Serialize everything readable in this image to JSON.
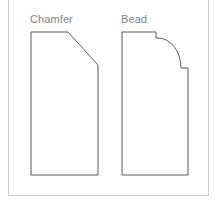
{
  "figure": {
    "background_color": "#ffffff",
    "frame": {
      "name": "diagram-frame",
      "border_color": "#c8cacc",
      "x": 8,
      "y": 0,
      "width": 201,
      "height": 196
    },
    "line_color": "#58595b",
    "label_color": "#808285"
  },
  "shapes": [
    {
      "id": "chamfer",
      "label": "Chamfer",
      "type": "chamfer-profile",
      "description": "Rectangular profile with top-right corner cut away at a 45 degree angle",
      "label_x": 30,
      "label_y": 13,
      "path": "M 31 32 L 68 32 L 98 65 L 98 175 L 31 175 Z",
      "vertices": [
        [
          31,
          32
        ],
        [
          68,
          32
        ],
        [
          98,
          65
        ],
        [
          98,
          175
        ],
        [
          31,
          175
        ]
      ]
    },
    {
      "id": "bead",
      "label": "Bead",
      "type": "bead-profile",
      "description": "Rectangular profile with a convex quarter-round arc between two small square step notches",
      "label_x": 121,
      "label_y": 13,
      "path": "M 122 32 L 156 32 L 156 38 L 158 38 A 23 30 0 0 1 181 68 L 181 68 L 188 68 L 188 175 L 122 175 Z",
      "vertices": [
        [
          122,
          32
        ],
        [
          156,
          32
        ],
        [
          156,
          38
        ],
        [
          158,
          38
        ],
        [
          181,
          68
        ],
        [
          188,
          68
        ],
        [
          188,
          175
        ],
        [
          122,
          175
        ]
      ],
      "arc": {
        "start": [
          158,
          38
        ],
        "end": [
          181,
          68
        ],
        "rx": 23,
        "ry": 30,
        "sweep": "convex-outward"
      }
    }
  ]
}
